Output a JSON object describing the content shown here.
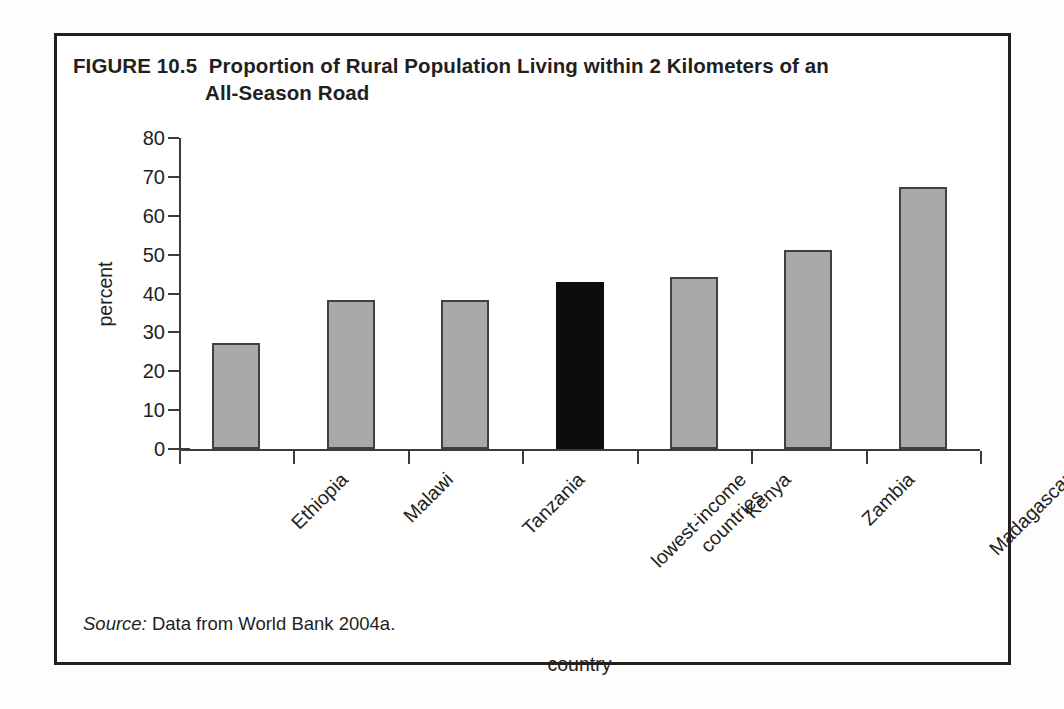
{
  "figure": {
    "number_label": "FIGURE 10.5",
    "title_line_1": "Proportion of Rural Population Living within 2 Kilometers of an",
    "title_line_2": "All-Season Road",
    "source_label": "Source:",
    "source_text": "Data from World Bank 2004a."
  },
  "colors": {
    "bar_fill": "#a9a9a9",
    "bar_outline": "#414141",
    "highlight_fill": "#0d0d0d",
    "axis": "#3b3b3b",
    "text": "#231f20",
    "frame": "#231f20"
  },
  "chart_data": {
    "type": "bar",
    "xlabel": "country",
    "ylabel": "percent",
    "ylim": [
      0,
      80
    ],
    "yticks": [
      0,
      10,
      20,
      30,
      40,
      50,
      60,
      70,
      80
    ],
    "ytick_labels": [
      "0",
      "10",
      "20",
      "30",
      "40",
      "50",
      "60",
      "70",
      "80"
    ],
    "grid": false,
    "legend": false,
    "categories": [
      "Ethiopia",
      "Malawi",
      "Tanzania",
      "lowest-income countries",
      "Kenya",
      "Zambia",
      "Madagascar"
    ],
    "category_lines": [
      [
        "Ethiopia"
      ],
      [
        "Malawi"
      ],
      [
        "Tanzania"
      ],
      [
        "lowest-income",
        "countries"
      ],
      [
        "Kenya"
      ],
      [
        "Zambia"
      ],
      [
        "Madagascar"
      ]
    ],
    "values": [
      27.2,
      38.4,
      38.4,
      43.0,
      44.2,
      51.3,
      67.5
    ],
    "highlight_index": 3,
    "series": [
      {
        "name": "percent of rural population within 2 km of an all-season road",
        "values": [
          27.2,
          38.4,
          38.4,
          43.0,
          44.2,
          51.3,
          67.5
        ]
      }
    ]
  }
}
